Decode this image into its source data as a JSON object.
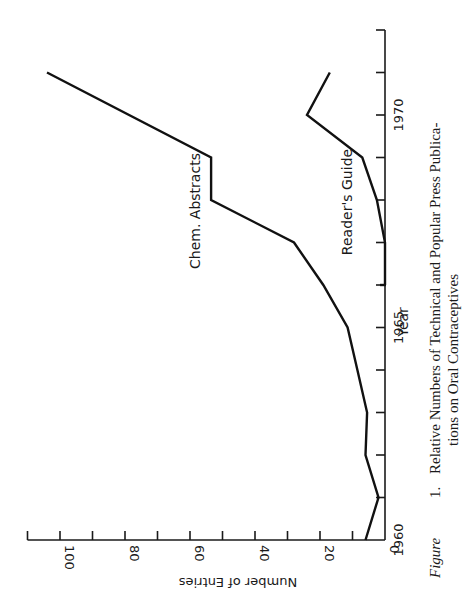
{
  "chart_data": {
    "type": "line",
    "orientation": "rotated-90-clockwise",
    "caption": {
      "prefix": "Figure",
      "number": "1.",
      "line1": "Relative Numbers of Technical and Popular Press Publica-",
      "line2": "tions on Oral Contraceptives"
    },
    "xlabel": "Year",
    "ylabel": "Number of Entries",
    "xlim": [
      1960,
      1972
    ],
    "ylim": [
      0,
      110
    ],
    "x_ticks": [
      1960,
      1961,
      1962,
      1963,
      1964,
      1965,
      1966,
      1967,
      1968,
      1969,
      1970,
      1971,
      1972
    ],
    "x_tick_labels": [
      {
        "value": 1960,
        "label": "1960"
      },
      {
        "value": 1965,
        "label": "1965"
      },
      {
        "value": 1970,
        "label": "1970"
      }
    ],
    "y_ticks": [
      0,
      10,
      20,
      30,
      40,
      50,
      60,
      70,
      80,
      90,
      100,
      110
    ],
    "y_tick_labels": [
      {
        "value": 0,
        "label": "0"
      },
      {
        "value": 20,
        "label": "20"
      },
      {
        "value": 40,
        "label": "40"
      },
      {
        "value": 60,
        "label": "60"
      },
      {
        "value": 80,
        "label": "80"
      },
      {
        "value": 100,
        "label": "100"
      }
    ],
    "grid": false,
    "legend": "inline labels",
    "series": [
      {
        "name": "Chem. Abstracts",
        "points": [
          [
            1960,
            6
          ],
          [
            1961,
            2
          ],
          [
            1962,
            6
          ],
          [
            1963,
            5.5
          ],
          [
            1964,
            8.5
          ],
          [
            1965,
            11.5
          ],
          [
            1966,
            19
          ],
          [
            1967,
            28
          ],
          [
            1968,
            53.5
          ],
          [
            1969,
            53.5
          ],
          [
            1971,
            104
          ]
        ],
        "label_pos": {
          "x": 200,
          "y": 211
        }
      },
      {
        "name": "Reader's Guide",
        "points": [
          [
            1966,
            0
          ],
          [
            1967,
            0
          ],
          [
            1968,
            2.5
          ],
          [
            1969,
            7
          ],
          [
            1970,
            24
          ],
          [
            1971,
            17
          ]
        ],
        "label_pos": {
          "x": 352,
          "y": 202
        }
      }
    ]
  },
  "layout": {
    "origin_px": {
      "x": 385,
      "y": 540
    },
    "px_per_year": 42.5,
    "px_per_entry": 3.25
  }
}
